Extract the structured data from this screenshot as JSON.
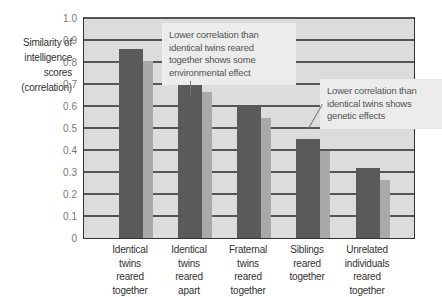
{
  "chart_data": {
    "type": "bar",
    "title": "",
    "ylabel": "Similarity of intelligence scores (correlation)",
    "ylabel_lines": [
      "Similarity of",
      "intelligence",
      "scores",
      "(correlation)"
    ],
    "xlabel": "",
    "ylim": [
      0,
      1.0
    ],
    "yticks": [
      "0",
      "0.1",
      "0.2",
      "0.3",
      "0.4",
      "0.5",
      "0.6",
      "0.7",
      "0.8",
      "0.9",
      "1.0"
    ],
    "grid": true,
    "categories": [
      "Identical twins reared together",
      "Identical twins reared apart",
      "Fraternal twins reared together",
      "Siblings reared together",
      "Unrelated individuals reared together"
    ],
    "category_lines": [
      [
        "Identical",
        "twins",
        "reared",
        "together"
      ],
      [
        "Identical",
        "twins",
        "reared",
        "apart"
      ],
      [
        "Fraternal",
        "twins",
        "reared",
        "together"
      ],
      [
        "Siblings",
        "reared",
        "together"
      ],
      [
        "Unrelated",
        "individuals",
        "reared",
        "together"
      ]
    ],
    "values": [
      0.86,
      0.72,
      0.6,
      0.45,
      0.32
    ],
    "annotations": [
      {
        "text": "Lower correlation than identical twins reared together shows some environmental effect",
        "lines": [
          "Lower correlation than",
          "identical twins reared",
          "together shows some",
          "environmental effect"
        ],
        "points_to": "Identical twins reared apart"
      },
      {
        "text": "Lower correlation than identical twins shows genetic effects",
        "lines": [
          "Lower correlation than",
          "identical twins shows",
          "genetic effects"
        ],
        "points_to": "Fraternal twins reared together"
      }
    ],
    "colors": {
      "bar": "#5a5a5a",
      "bar_shadow": "#a9a9a9",
      "plot_background": "#dcdcdc",
      "gridline": "#555555",
      "callout_background": "#ececec"
    }
  }
}
